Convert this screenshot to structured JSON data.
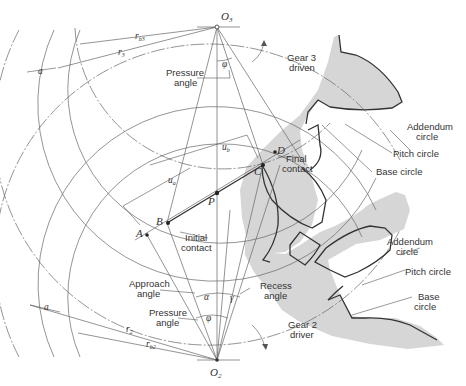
{
  "figure": {
    "points": {
      "O3": "O",
      "O3_sub": "3",
      "O2": "O",
      "O2_sub": "2",
      "P": "P",
      "A": "A",
      "B": "B",
      "C": "C",
      "D": "D"
    },
    "dimensions": {
      "rb3": "r",
      "rb3_sub": "b3",
      "r3": "r",
      "r3_sub": "3",
      "r2": "r",
      "r2_sub": "2",
      "rb2": "r",
      "rb2_sub": "b2",
      "a_top": "a",
      "a_bottom": "a",
      "ua": "u",
      "ua_sub": "a",
      "ub": "u",
      "ub_sub": "b"
    },
    "angles": {
      "phi_top": "φ",
      "phi_bottom": "φ",
      "alpha": "α",
      "gamma": "γ"
    },
    "labels": {
      "pressure_angle_top_1": "Pressure",
      "pressure_angle_top_2": "angle",
      "gear3_1": "Gear 3",
      "gear3_2": "driven",
      "final_contact_1": "Final",
      "final_contact_2": "contact",
      "initial_contact_1": "Initial",
      "initial_contact_2": "contact",
      "addendum_top_1": "Addendum",
      "addendum_top_2": "circle",
      "pitch_top": "Pitch circle",
      "base_top": "Base circle",
      "addendum_bottom_1": "Addendum",
      "addendum_bottom_2": "circle",
      "pitch_bottom": "Pitch circle",
      "base_bottom_1": "Base",
      "base_bottom_2": "circle",
      "approach_angle_1": "Approach",
      "approach_angle_2": "angle",
      "pressure_angle_bottom_1": "Pressure",
      "pressure_angle_bottom_2": "angle",
      "recess_angle_1": "Recess",
      "recess_angle_2": "angle",
      "gear2_1": "Gear 2",
      "gear2_2": "driver"
    },
    "colors": {
      "gear_fill": "#d6d6d6",
      "line": "#666666",
      "outline": "#333333"
    }
  }
}
